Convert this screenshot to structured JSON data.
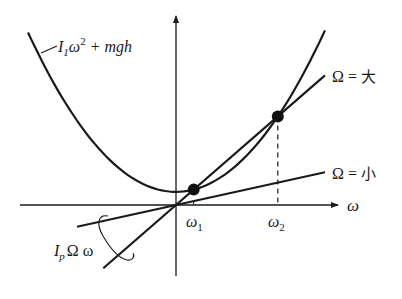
{
  "chart_data": {
    "type": "line",
    "title": "",
    "xlabel": "ω",
    "ylabel": "",
    "xlim": [
      -1.55,
      1.6
    ],
    "ylim": [
      -0.7,
      1.85
    ],
    "grid": false,
    "curves": {
      "parabola": {
        "name": "I1ω^2 + mgh",
        "a": 0.735,
        "center": 0.0,
        "offset": 0.13,
        "range": [
          -1.465,
          1.475
        ]
      },
      "line_large": {
        "name": "Ω = 大",
        "slope": 0.87,
        "range": [
          -0.72,
          1.475
        ]
      },
      "line_small": {
        "name": "Ω = 小",
        "slope": 0.22,
        "range": [
          -0.98,
          1.475
        ]
      }
    },
    "intersections": [
      {
        "name": "ω1",
        "x": 0.175
      },
      {
        "name": "ω2",
        "x": 1.008
      }
    ]
  },
  "labels": {
    "parabola_main": "I",
    "parabola_sub": "1",
    "parabola_omega": "ω",
    "parabola_sup": "2",
    "parabola_tail": " + mgh",
    "large_omega": "Ω",
    "large_eq": " = ",
    "large_word": "大",
    "small_omega": "Ω",
    "small_eq": " = ",
    "small_word": "小",
    "lines_I": "I",
    "lines_sub": "p",
    "lines_rest": "Ω ω",
    "x_axis": "ω",
    "omega1": "ω",
    "omega1_sub": "1",
    "omega2": "ω",
    "omega2_sub": "2"
  }
}
